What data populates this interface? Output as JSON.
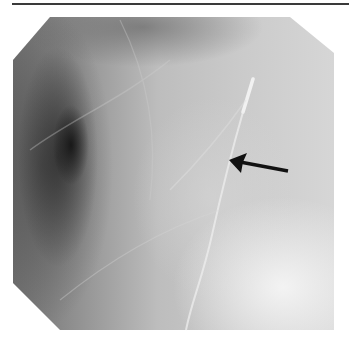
{
  "figure": {
    "type": "radiograph",
    "annotations": [
      {
        "kind": "arrow",
        "color": "#111111",
        "tail": [
          288,
          170
        ],
        "head": [
          229,
          160
        ],
        "points_to": "thin linear radiopaque structure (wire/catheter)"
      }
    ],
    "colors": {
      "background": "#ffffff",
      "top_rule": "#3a3a3a",
      "dark_region": "#1a1a1a",
      "bright_region": "#f2f2f2"
    }
  }
}
